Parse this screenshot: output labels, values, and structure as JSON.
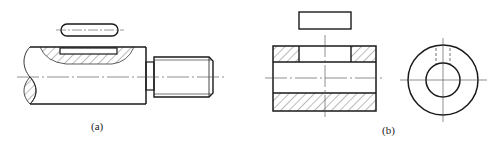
{
  "figure": {
    "subfigures": [
      {
        "id": "a",
        "label": "(a)",
        "description": "Shaft with keyseat, rounded-end key shown above, partial section with hatching, threaded shaft end on right"
      },
      {
        "id": "b",
        "label": "(b)",
        "description": "Hub in longitudinal section with keyway, rectangular key shown above, and end view showing concentric circles with hidden keyway lines"
      }
    ],
    "colors": {
      "line": "#1a1a1a",
      "hatch": "#555555",
      "background": "#ffffff"
    }
  }
}
